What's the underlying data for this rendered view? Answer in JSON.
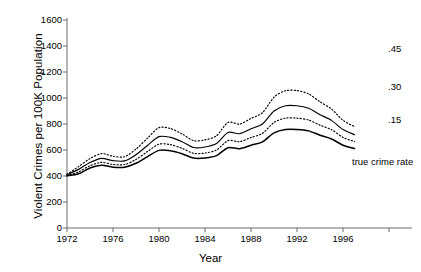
{
  "chart_data": {
    "type": "line",
    "title": "",
    "xlabel": "Year",
    "ylabel": "Violent Crimes per 100K Population",
    "xlim": [
      1972,
      1997.5
    ],
    "ylim": [
      0,
      1600
    ],
    "grid": false,
    "legend_position": "right-inline",
    "x_ticks": [
      "1972",
      "1976",
      "1980",
      "1984",
      "1988",
      "1992",
      "1996"
    ],
    "y_ticks": [
      "0",
      "200",
      "400",
      "600",
      "800",
      "1000",
      "1200",
      "1400",
      "1600"
    ],
    "x": [
      1972,
      1973,
      1974,
      1975,
      1976,
      1977,
      1978,
      1979,
      1980,
      1981,
      1982,
      1983,
      1984,
      1985,
      1986,
      1987,
      1988,
      1989,
      1990,
      1991,
      1992,
      1993,
      1994,
      1995,
      1996,
      1997
    ],
    "series": [
      {
        "name": "true crime rate",
        "label": "true crime rate",
        "style": "solid-bold",
        "values": [
          401,
          417,
          461,
          482,
          468,
          468,
          498,
          549,
          597,
          594,
          571,
          538,
          539,
          557,
          618,
          610,
          637,
          663,
          732,
          758,
          758,
          747,
          714,
          685,
          637,
          611
        ]
      },
      {
        "name": ".15",
        "label": ".15",
        "style": "dotted",
        "values": [
          404,
          432,
          479,
          505,
          489,
          488,
          527,
          588,
          645,
          641,
          613,
          575,
          577,
          600,
          672,
          664,
          696,
          728,
          812,
          845,
          845,
          831,
          791,
          756,
          697,
          665
        ]
      },
      {
        "name": ".30",
        "label": ".30",
        "style": "solid",
        "values": [
          409,
          451,
          504,
          536,
          518,
          516,
          564,
          635,
          703,
          697,
          664,
          619,
          623,
          650,
          735,
          725,
          763,
          800,
          900,
          940,
          940,
          921,
          872,
          828,
          757,
          718
        ]
      },
      {
        "name": ".45",
        "label": ".45",
        "style": "dotted",
        "values": [
          413,
          472,
          534,
          572,
          552,
          548,
          607,
          691,
          772,
          765,
          724,
          672,
          678,
          710,
          812,
          799,
          843,
          887,
          1006,
          1056,
          1057,
          1032,
          971,
          915,
          828,
          780
        ]
      }
    ],
    "annotations": [
      {
        "text": ".45",
        "x": 1997.6,
        "y": 1300
      },
      {
        "text": ".30",
        "x": 1997.6,
        "y": 1070
      },
      {
        "text": ".15",
        "x": 1997.6,
        "y": 855
      },
      {
        "text": "true crime rate",
        "x": 1994.0,
        "y": 525
      }
    ]
  }
}
